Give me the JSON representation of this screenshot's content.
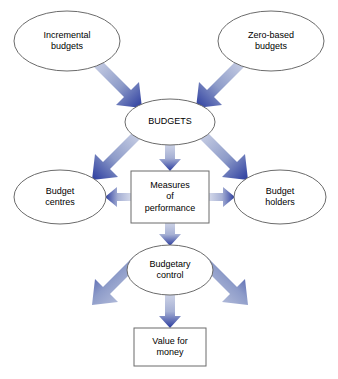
{
  "figure": {
    "type": "flow-diagram",
    "background_color": "#ffffff",
    "width": 338,
    "height": 379
  },
  "style": {
    "node_outline_color": "#6b6b6b",
    "node_fill_color": "#ffffff",
    "arrow_gradient_start": "#ccd2e6",
    "arrow_gradient_end": "#2a3b9e",
    "text_color": "#000000"
  },
  "nodes": {
    "incremental_budgets": {
      "shape": "ellipse",
      "lines": [
        "Incremental",
        "budgets"
      ],
      "cx": 67,
      "cy": 41,
      "rx": 53,
      "ry": 30
    },
    "zero_based_budgets": {
      "shape": "ellipse",
      "lines": [
        "Zero-based",
        "budgets"
      ],
      "cx": 271,
      "cy": 41,
      "rx": 53,
      "ry": 30
    },
    "budgets": {
      "shape": "ellipse",
      "lines": [
        "BUDGETS"
      ],
      "cx": 170,
      "cy": 122,
      "rx": 45,
      "ry": 23
    },
    "budget_centres": {
      "shape": "ellipse",
      "lines": [
        "Budget",
        "centres"
      ],
      "cx": 60,
      "cy": 197,
      "rx": 46,
      "ry": 27
    },
    "measures_of_performance": {
      "shape": "rectangle",
      "lines": [
        "Measures",
        "of",
        "performance"
      ],
      "x": 131,
      "y": 171,
      "width": 78,
      "height": 52
    },
    "budget_holders": {
      "shape": "ellipse",
      "lines": [
        "Budget",
        "holders"
      ],
      "cx": 280,
      "cy": 197,
      "rx": 46,
      "ry": 27
    },
    "budgetary_control": {
      "shape": "ellipse",
      "lines": [
        "Budgetary",
        "control"
      ],
      "cx": 170,
      "cy": 270,
      "rx": 43,
      "ry": 25
    },
    "value_for_money": {
      "shape": "rectangle",
      "lines": [
        "Value for",
        "money"
      ],
      "x": 134,
      "y": 328,
      "width": 72,
      "height": 38
    }
  },
  "edges": [
    {
      "name": "incremental-to-budgets",
      "from": "incremental_budgets",
      "to": "budgets",
      "direction": "one-way"
    },
    {
      "name": "zero-based-to-budgets",
      "from": "zero_based_budgets",
      "to": "budgets",
      "direction": "one-way"
    },
    {
      "name": "budgets-to-budget-centres",
      "from": "budgets",
      "to": "budget_centres",
      "direction": "one-way"
    },
    {
      "name": "budgets-to-measures",
      "from": "budgets",
      "to": "measures_of_performance",
      "direction": "one-way"
    },
    {
      "name": "budgets-to-budget-holders",
      "from": "budgets",
      "to": "budget_holders",
      "direction": "one-way"
    },
    {
      "name": "measures-to-budget-centres",
      "from": "measures_of_performance",
      "to": "budget_centres",
      "direction": "one-way"
    },
    {
      "name": "measures-to-budget-holders",
      "from": "measures_of_performance",
      "to": "budget_holders",
      "direction": "one-way"
    },
    {
      "name": "measures-to-budgetary-control",
      "from": "measures_of_performance",
      "to": "budgetary_control",
      "direction": "one-way"
    },
    {
      "name": "budgetary-control-to-budget-centres",
      "from": "budgetary_control",
      "to": "budget_centres",
      "direction": "one-way"
    },
    {
      "name": "budgetary-control-to-budget-holders",
      "from": "budgetary_control",
      "to": "budget_holders",
      "direction": "one-way"
    },
    {
      "name": "budgetary-control-to-value-for-money",
      "from": "budgetary_control",
      "to": "value_for_money",
      "direction": "one-way"
    }
  ]
}
